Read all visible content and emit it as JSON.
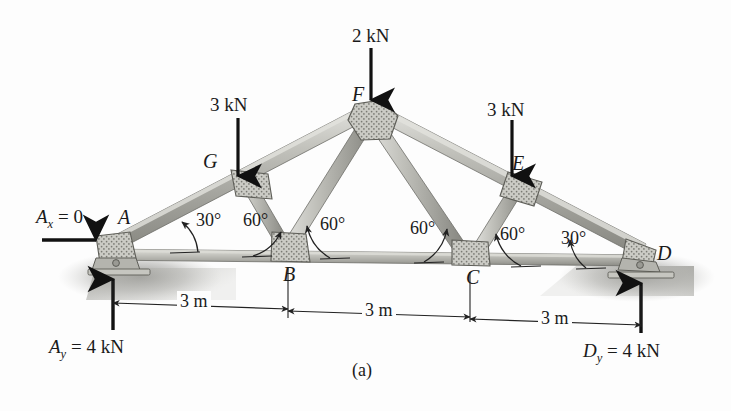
{
  "figure": {
    "caption": "(a)",
    "type": "truss-free-body-diagram"
  },
  "loads": [
    {
      "name": "load-G",
      "label": "3 kN",
      "joint": "G",
      "value": 3,
      "unit": "kN",
      "direction": "down"
    },
    {
      "name": "load-F",
      "label": "2 kN",
      "joint": "F",
      "value": 2,
      "unit": "kN",
      "direction": "down"
    },
    {
      "name": "load-E",
      "label": "3 kN",
      "joint": "E",
      "value": 3,
      "unit": "kN",
      "direction": "down"
    }
  ],
  "joints": {
    "A": "A",
    "B": "B",
    "C": "C",
    "D": "D",
    "E": "E",
    "F": "F",
    "G": "G"
  },
  "angles": [
    {
      "name": "angle-A-30",
      "label": "30°",
      "value": 30
    },
    {
      "name": "angle-A-60",
      "label": "60°",
      "value": 60
    },
    {
      "name": "angle-B-left-60",
      "label": "60°",
      "value": 60
    },
    {
      "name": "angle-C-right-60",
      "label": "60°",
      "value": 60
    },
    {
      "name": "angle-C-60",
      "label": "60°",
      "value": 60
    },
    {
      "name": "angle-D-30",
      "label": "30°",
      "value": 30
    }
  ],
  "dimensions": [
    {
      "name": "dim-A-B",
      "label": "3 m",
      "value": 3,
      "unit": "m"
    },
    {
      "name": "dim-B-C",
      "label": "3 m",
      "value": 3,
      "unit": "m"
    },
    {
      "name": "dim-C-D",
      "label": "3 m",
      "value": 3,
      "unit": "m"
    }
  ],
  "reactions": {
    "ax": {
      "sym": "A",
      "sub": "x",
      "rest": " = 0",
      "full": "A_x = 0"
    },
    "ay": {
      "sym": "A",
      "sub": "y",
      "rest": " = 4 kN",
      "full": "A_y = 4 kN"
    },
    "dy": {
      "sym": "D",
      "sub": "y",
      "rest": " = 4 kN",
      "full": "D_y = 4 kN"
    }
  },
  "colors": {
    "member": "#b9b9b4",
    "member_dark": "#8b8b86",
    "gusset": "#cfcfc9",
    "ink": "#1a1a1a",
    "ground": "#9a9a95",
    "background": "#fdfdfd"
  }
}
